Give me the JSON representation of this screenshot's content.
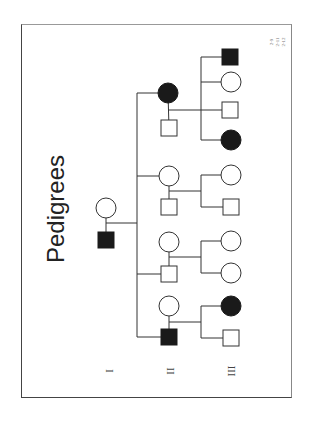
{
  "slide": {
    "title": "Pedigrees",
    "orientation": "rotated 90deg clockwise",
    "reference_labels": [
      "2-9",
      "2-11",
      "2-12"
    ],
    "generation_labels": [
      {
        "label": "I",
        "x": 109,
        "y": 371
      },
      {
        "label": "II",
        "x": 170,
        "y": 371
      },
      {
        "label": "III",
        "x": 231,
        "y": 371
      }
    ]
  },
  "pedigree": {
    "generation_I": [
      {
        "id": "I-1",
        "sex": "female",
        "affected": false,
        "cx": 106,
        "cy": 208
      },
      {
        "id": "I-2",
        "sex": "male",
        "affected": true,
        "cx": 106,
        "cy": 240
      }
    ],
    "generation_II_couples": [
      {
        "child": {
          "sex": "female",
          "affected": true,
          "cx": 168,
          "cy": 93
        },
        "spouse": {
          "sex": "male",
          "affected": false,
          "cx": 169,
          "cy": 128
        },
        "mating_y": 110,
        "offspring": [
          {
            "sex": "male",
            "affected": true,
            "cx": 230,
            "cy": 57
          },
          {
            "sex": "female",
            "affected": false,
            "cx": 231,
            "cy": 82
          },
          {
            "sex": "male",
            "affected": false,
            "cx": 230,
            "cy": 110
          },
          {
            "sex": "female",
            "affected": true,
            "cx": 231,
            "cy": 140
          }
        ]
      },
      {
        "child": {
          "sex": "female",
          "affected": false,
          "cx": 169,
          "cy": 176
        },
        "spouse": {
          "sex": "male",
          "affected": false,
          "cx": 169,
          "cy": 207
        },
        "mating_y": 191,
        "offspring": [
          {
            "sex": "female",
            "affected": false,
            "cx": 231,
            "cy": 175
          },
          {
            "sex": "male",
            "affected": false,
            "cx": 231,
            "cy": 207
          }
        ]
      },
      {
        "child": {
          "sex": "male",
          "affected": false,
          "cx": 169,
          "cy": 274
        },
        "spouse": {
          "sex": "female",
          "affected": false,
          "cx": 169,
          "cy": 242
        },
        "mating_y": 257,
        "offspring": [
          {
            "sex": "female",
            "affected": false,
            "cx": 231,
            "cy": 241
          },
          {
            "sex": "female",
            "affected": false,
            "cx": 231,
            "cy": 273
          }
        ]
      },
      {
        "child": {
          "sex": "male",
          "affected": true,
          "cx": 169,
          "cy": 337
        },
        "spouse": {
          "sex": "female",
          "affected": false,
          "cx": 169,
          "cy": 306
        },
        "mating_y": 322,
        "offspring": [
          {
            "sex": "female",
            "affected": true,
            "cx": 231,
            "cy": 306
          },
          {
            "sex": "male",
            "affected": false,
            "cx": 231,
            "cy": 338
          }
        ]
      }
    ],
    "sibship_line_II": {
      "x": 137,
      "y1": 93,
      "y2": 337,
      "parent_mating_y": 223
    },
    "sibship_line_III_x": 201,
    "symbol_size": 16,
    "circle_radius": 10
  },
  "colors": {
    "affected": "#1a1a1a",
    "unaffected": "#ffffff",
    "line": "#333333"
  }
}
